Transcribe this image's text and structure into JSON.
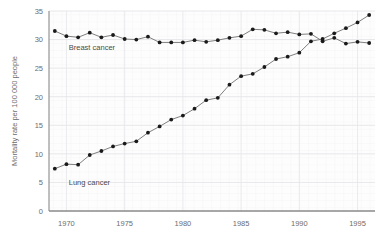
{
  "chart_data": {
    "type": "line",
    "title": "",
    "xlabel": "",
    "ylabel": "Mortality rate per 100 000 people",
    "xlim": [
      1968.5,
      1996.5
    ],
    "ylim": [
      0,
      35
    ],
    "xticks": [
      1970,
      1975,
      1980,
      1985,
      1990,
      1995
    ],
    "xtick_labels": [
      "1970",
      "1975",
      "1980",
      "1985",
      "1990",
      "1995"
    ],
    "yticks": [
      0,
      5,
      10,
      15,
      20,
      25,
      30,
      35
    ],
    "ytick_labels": [
      "0",
      "5",
      "10",
      "15",
      "20",
      "25",
      "30",
      "35"
    ],
    "grid": true,
    "legend": "inline-annotations",
    "marker": "filled-circle",
    "x": [
      1969,
      1970,
      1971,
      1972,
      1973,
      1974,
      1975,
      1976,
      1977,
      1978,
      1979,
      1980,
      1981,
      1982,
      1983,
      1984,
      1985,
      1986,
      1987,
      1988,
      1989,
      1990,
      1991,
      1992,
      1993,
      1994,
      1995,
      1996
    ],
    "series": [
      {
        "name": "Breast cancer",
        "color": "#1a1a1a",
        "label_x": 1970.2,
        "label_y": 28.2,
        "values": [
          31.5,
          30.6,
          30.4,
          31.2,
          30.4,
          30.8,
          30.1,
          30.0,
          30.5,
          29.5,
          29.5,
          29.5,
          29.9,
          29.6,
          29.9,
          30.3,
          30.6,
          31.8,
          31.7,
          31.1,
          31.3,
          30.9,
          31.0,
          29.7,
          30.3,
          29.3,
          29.6,
          29.4
        ]
      },
      {
        "name": "Lung cancer",
        "color": "#1a1a1a",
        "label_x": 1970.2,
        "label_y": 4.6,
        "values": [
          7.4,
          8.2,
          8.1,
          9.8,
          10.5,
          11.3,
          11.8,
          12.2,
          13.7,
          14.8,
          16.0,
          16.7,
          17.9,
          19.4,
          19.8,
          22.1,
          23.6,
          24.0,
          25.2,
          26.6,
          27.0,
          27.7,
          29.7,
          30.1,
          31.1,
          32.0,
          33.0,
          34.3
        ]
      }
    ]
  },
  "axes": {
    "y_axis_title": "Mortality rate per 100 000 people"
  }
}
